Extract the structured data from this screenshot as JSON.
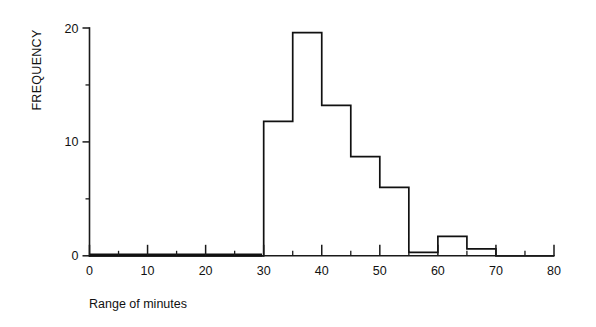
{
  "chart_data": {
    "type": "bar",
    "title": "",
    "subtitle": "",
    "xlabel": "Range of minutes",
    "ylabel": "FREQUENCY",
    "xlim": [
      0,
      80
    ],
    "ylim": [
      0,
      20
    ],
    "grid": false,
    "legend": null,
    "bin_width": 5,
    "x_tick_labels": [
      "0",
      "10",
      "20",
      "30",
      "40",
      "50",
      "60",
      "70",
      "80"
    ],
    "x_ticks_major": [
      0,
      10,
      20,
      30,
      40,
      50,
      60,
      70,
      80
    ],
    "x_ticks_minor": [
      5,
      15,
      25,
      35,
      45,
      55,
      65,
      75
    ],
    "y_tick_labels": [
      "0",
      "10",
      "20"
    ],
    "y_ticks_major": [
      0,
      10,
      20
    ],
    "y_ticks_minor": [
      5,
      15
    ],
    "categories": [
      "0-5",
      "5-10",
      "10-15",
      "15-20",
      "20-25",
      "25-30",
      "30-35",
      "35-40",
      "40-45",
      "45-50",
      "50-55",
      "55-60",
      "60-65",
      "65-70",
      "70-75",
      "75-80"
    ],
    "bin_edges": [
      0,
      5,
      10,
      15,
      20,
      25,
      30,
      35,
      40,
      45,
      50,
      55,
      60,
      65,
      70,
      75,
      80
    ],
    "values": [
      0,
      0,
      0,
      0,
      0,
      0,
      11.8,
      19.6,
      13.2,
      8.7,
      6.0,
      0.3,
      1.7,
      0.6,
      0,
      0
    ],
    "colors": {
      "bar_fill": "#ffffff",
      "bar_stroke": "#111111",
      "axis": "#1a1a1a",
      "text": "#111111",
      "background": "#ffffff"
    }
  },
  "axes": {
    "y_axis_title": "FREQUENCY",
    "x_axis_title": "Range of minutes"
  }
}
